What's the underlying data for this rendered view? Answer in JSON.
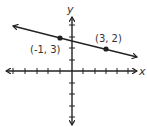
{
  "diagram": {
    "type": "coordinate-plane-line",
    "axes": {
      "x_label": "x",
      "y_label": "y",
      "x_ticks": [
        -6,
        -5,
        -4,
        -3,
        -2,
        -1,
        1,
        2,
        3,
        4,
        5,
        6
      ],
      "y_ticks": [
        -6,
        -5,
        -4,
        -3,
        -2,
        -1,
        1,
        2,
        3,
        4,
        5
      ],
      "arrows": true
    },
    "line": {
      "description": "line through (-1, 3) and (3, 2), arrows at both ends",
      "slope": "-1/4"
    },
    "points": [
      {
        "label": "(-1, 3)",
        "x": -1,
        "y": 3
      },
      {
        "label": "(3, 2)",
        "x": 3,
        "y": 2
      }
    ],
    "colors": {
      "ink": "#222222",
      "background": "#ffffff"
    }
  }
}
